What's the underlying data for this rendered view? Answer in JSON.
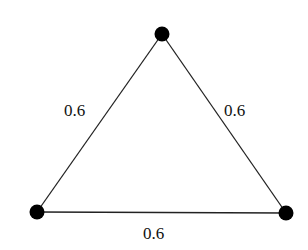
{
  "graph": {
    "type": "weighted-triangle-graph",
    "nodes": [
      {
        "id": "top",
        "x": 162,
        "y": 34
      },
      {
        "id": "bottom-left",
        "x": 37,
        "y": 212
      },
      {
        "id": "bottom-right",
        "x": 286,
        "y": 213
      }
    ],
    "edges": [
      {
        "from": "top",
        "to": "bottom-left",
        "weight": "0.6"
      },
      {
        "from": "top",
        "to": "bottom-right",
        "weight": "0.6"
      },
      {
        "from": "bottom-left",
        "to": "bottom-right",
        "weight": "0.6"
      }
    ],
    "labels": {
      "left_edge": "0.6",
      "right_edge": "0.6",
      "bottom_edge": "0.6"
    },
    "colors": {
      "node": "#000000",
      "edge": "#222222",
      "text": "#111111",
      "background": "#ffffff"
    }
  }
}
